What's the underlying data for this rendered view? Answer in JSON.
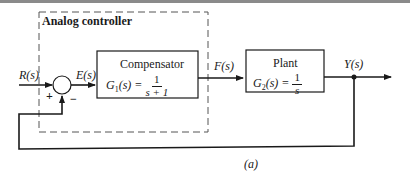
{
  "diagram": {
    "type": "block-diagram",
    "caption": "(a)",
    "group": {
      "label": "Analog controller",
      "style": "dashed"
    },
    "signals": {
      "input": "R(s)",
      "error": "E(s)",
      "control": "F(s)",
      "output": "Y(s)"
    },
    "summing_junction": {
      "plus_sign": "+",
      "minus_sign": "−"
    },
    "blocks": [
      {
        "name": "Compensator",
        "lhs": "G",
        "sub": "1",
        "arg": "(s) =",
        "numerator": "1",
        "denominator": "s + 1"
      },
      {
        "name": "Plant",
        "lhs": "G",
        "sub": "2",
        "arg": "(s) =",
        "numerator": "1",
        "denominator": "s"
      }
    ],
    "colors": {
      "line": "#1a1a1a",
      "dashed_box": "#555555",
      "background": "#ffffff"
    }
  }
}
